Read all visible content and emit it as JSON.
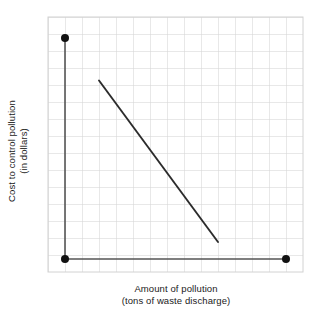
{
  "chart_data": {
    "type": "line",
    "title": "",
    "subtitle": "",
    "xlabel_line1": "Amount of pollution",
    "xlabel_line2": "(tons of waste discharge)",
    "ylabel_line1": "Cost to control pollution",
    "ylabel_line2": "(in dollars)",
    "grid": true,
    "grid_columns": 15,
    "grid_rows": 15,
    "grid_cell_px": 17,
    "xlim": [
      0,
      15
    ],
    "ylim": [
      0,
      15
    ],
    "axis_tick_labels_x": [],
    "axis_tick_labels_y": [],
    "legend": [],
    "axes": {
      "y_axis_from": [
        1,
        1
      ],
      "y_axis_to": [
        1,
        14
      ],
      "x_axis_from": [
        1,
        1
      ],
      "x_axis_to": [
        14,
        1
      ]
    },
    "series": [
      {
        "name": "cost-to-control-pollution",
        "type": "line",
        "points": [
          {
            "x": 3,
            "y": 11.5
          },
          {
            "x": 10,
            "y": 2.0
          }
        ],
        "slope": "negative",
        "color": "#2b2b2b"
      },
      {
        "name": "axis-endpoint-markers",
        "type": "scatter",
        "points": [
          {
            "x": 1,
            "y": 14
          },
          {
            "x": 1,
            "y": 1
          },
          {
            "x": 14,
            "y": 1
          }
        ],
        "color": "#111111"
      }
    ],
    "colors": {
      "gridline": "#d2d2d2",
      "axis_line": "#555555",
      "data_line": "#2b2b2b",
      "marker": "#111111",
      "background": "#ffffff",
      "text": "#1a1a1a"
    },
    "annotations": []
  },
  "figure": {
    "plot_area": {
      "left_px": 48,
      "top_px": 17,
      "right_px": 303,
      "bottom_px": 276
    }
  }
}
